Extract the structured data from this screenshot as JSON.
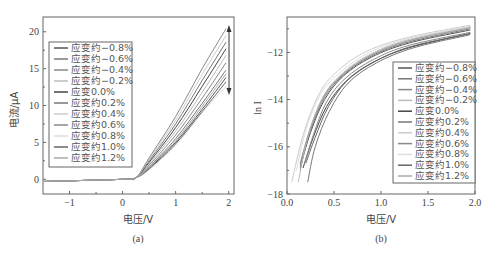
{
  "chart_data": [
    {
      "type": "line",
      "panel_label": "(a)",
      "title": "",
      "xlabel": "电压/V",
      "ylabel": "电流/μA",
      "xlim": [
        -1.5,
        2.1
      ],
      "ylim": [
        -2,
        22
      ],
      "xticks": [
        -1,
        0,
        1,
        2
      ],
      "xtick_labels": [
        "−1",
        "0",
        "1",
        "2"
      ],
      "yticks": [
        0,
        5,
        10,
        15,
        20
      ],
      "ytick_labels": [
        "0",
        "5",
        "10",
        "15",
        "20"
      ],
      "grid": false,
      "legend_position": "upper left",
      "annotation": "double-headed arrow at V=2 spanning ~12 to ~20.5 μA",
      "series": [
        {
          "name": "应变约−0.8%",
          "color": "#555555",
          "x": [
            -1.5,
            0,
            0.25,
            0.5,
            1.0,
            1.5,
            1.95
          ],
          "values": [
            -0.3,
            0,
            0.2,
            1.5,
            5.0,
            9.5,
            13.8
          ]
        },
        {
          "name": "应变约−0.6%",
          "color": "#777777",
          "x": [
            -1.5,
            0,
            0.25,
            0.5,
            1.0,
            1.5,
            1.95
          ],
          "values": [
            -0.3,
            0,
            0.2,
            1.7,
            5.5,
            10.3,
            14.8
          ]
        },
        {
          "name": "应变约−0.4%",
          "color": "#888888",
          "x": [
            -1.5,
            0,
            0.25,
            0.5,
            1.0,
            1.5,
            1.95
          ],
          "values": [
            -0.3,
            0,
            0.2,
            1.9,
            6.0,
            11.0,
            15.8
          ]
        },
        {
          "name": "应变约−0.2%",
          "color": "#bbbbbb",
          "x": [
            -1.5,
            0,
            0.25,
            0.5,
            1.0,
            1.5,
            1.95
          ],
          "values": [
            -0.3,
            0,
            0.2,
            2.1,
            6.5,
            11.8,
            16.8
          ]
        },
        {
          "name": "应变0.0%",
          "color": "#444444",
          "x": [
            -1.5,
            0,
            0.25,
            0.5,
            1.0,
            1.5,
            1.95
          ],
          "values": [
            -0.3,
            0,
            0.2,
            2.3,
            7.0,
            12.6,
            17.7
          ]
        },
        {
          "name": "应变约0.2%",
          "color": "#777777",
          "x": [
            -1.5,
            0,
            0.25,
            0.5,
            1.0,
            1.5,
            1.95
          ],
          "values": [
            -0.3,
            0,
            0.2,
            2.5,
            7.5,
            13.4,
            18.6
          ]
        },
        {
          "name": "应变约0.4%",
          "color": "#cccccc",
          "x": [
            -1.5,
            0,
            0.25,
            0.5,
            1.0,
            1.5,
            1.95
          ],
          "values": [
            -0.3,
            0,
            0.2,
            2.7,
            8.0,
            14.2,
            19.5
          ]
        },
        {
          "name": "应变约0.6%",
          "color": "#888888",
          "x": [
            -1.5,
            0,
            0.25,
            0.5,
            1.0,
            1.5,
            1.95
          ],
          "values": [
            -0.3,
            0,
            0.2,
            2.9,
            8.5,
            15.0,
            20.4
          ]
        },
        {
          "name": "应变约0.8%",
          "color": "#dddddd",
          "x": [
            -1.5,
            0,
            0.25,
            0.5,
            1.0,
            1.5,
            1.95
          ],
          "values": [
            -0.3,
            0,
            0.2,
            1.3,
            4.6,
            9.0,
            12.6
          ]
        },
        {
          "name": "应变约1.0%",
          "color": "#666666",
          "x": [
            -1.5,
            0,
            0.25,
            0.5,
            1.0,
            1.5,
            1.95
          ],
          "values": [
            -0.3,
            0,
            0.2,
            1.4,
            4.8,
            9.2,
            13.2
          ]
        },
        {
          "name": "应变约1.2%",
          "color": "#aaaaaa",
          "x": [
            -1.5,
            0,
            0.25,
            0.5,
            1.0,
            1.5,
            1.95
          ],
          "values": [
            -0.3,
            0,
            0.2,
            1.6,
            5.2,
            9.9,
            14.3
          ]
        }
      ]
    },
    {
      "type": "line",
      "panel_label": "(b)",
      "title": "",
      "xlabel": "电压/V",
      "ylabel": "ln I",
      "xlim": [
        0.0,
        2.0
      ],
      "ylim": [
        -18,
        -10.5
      ],
      "xticks": [
        0.0,
        0.5,
        1.0,
        1.5,
        2.0
      ],
      "xtick_labels": [
        "0.0",
        "0.5",
        "1.0",
        "1.5",
        "2.0"
      ],
      "yticks": [
        -18,
        -16,
        -14,
        -12
      ],
      "ytick_labels": [
        "−18",
        "−16",
        "−14",
        "−12"
      ],
      "grid": false,
      "legend_position": "center right",
      "series": [
        {
          "name": "应变约−0.8%",
          "color": "#555555",
          "x": [
            0.14,
            0.25,
            0.4,
            0.6,
            0.9,
            1.3,
            1.95
          ],
          "values": [
            -16.9,
            -15.4,
            -14.0,
            -13.0,
            -12.2,
            -11.6,
            -11.05
          ]
        },
        {
          "name": "应变约−0.6%",
          "color": "#777777",
          "x": [
            0.14,
            0.25,
            0.4,
            0.6,
            0.9,
            1.3,
            1.95
          ],
          "values": [
            -16.8,
            -15.3,
            -13.9,
            -12.95,
            -12.15,
            -11.55,
            -11.0
          ]
        },
        {
          "name": "应变约−0.4%",
          "color": "#888888",
          "x": [
            0.14,
            0.25,
            0.4,
            0.6,
            0.9,
            1.3,
            1.95
          ],
          "values": [
            -16.7,
            -15.2,
            -13.8,
            -12.9,
            -12.1,
            -11.5,
            -10.95
          ]
        },
        {
          "name": "应变约−0.2%",
          "color": "#bbbbbb",
          "x": [
            0.12,
            0.22,
            0.38,
            0.6,
            0.9,
            1.3,
            1.95
          ],
          "values": [
            -17.5,
            -15.6,
            -13.9,
            -12.85,
            -12.05,
            -11.45,
            -10.9
          ]
        },
        {
          "name": "应变0.0%",
          "color": "#444444",
          "x": [
            0.17,
            0.28,
            0.42,
            0.62,
            0.9,
            1.3,
            1.95
          ],
          "values": [
            -16.9,
            -15.6,
            -14.3,
            -13.25,
            -12.45,
            -11.8,
            -11.2
          ]
        },
        {
          "name": "应变约0.2%",
          "color": "#777777",
          "x": [
            0.22,
            0.3,
            0.45,
            0.65,
            0.95,
            1.35,
            1.95
          ],
          "values": [
            -17.5,
            -16.0,
            -14.5,
            -13.3,
            -12.45,
            -11.8,
            -11.25
          ]
        },
        {
          "name": "应变约0.4%",
          "color": "#cccccc",
          "x": [
            0.05,
            0.18,
            0.35,
            0.55,
            0.85,
            1.3,
            1.95
          ],
          "values": [
            -17.5,
            -15.4,
            -13.7,
            -12.75,
            -11.95,
            -11.35,
            -10.85
          ]
        },
        {
          "name": "应变约0.6%",
          "color": "#888888",
          "x": [
            0.18,
            0.28,
            0.42,
            0.62,
            0.92,
            1.3,
            1.95
          ],
          "values": [
            -16.8,
            -15.5,
            -14.1,
            -13.1,
            -12.3,
            -11.7,
            -11.15
          ]
        },
        {
          "name": "应变约0.8%",
          "color": "#dddddd",
          "x": [
            0.1,
            0.2,
            0.36,
            0.58,
            0.88,
            1.3,
            1.95
          ],
          "values": [
            -17.0,
            -15.3,
            -13.75,
            -12.8,
            -12.0,
            -11.4,
            -10.9
          ]
        },
        {
          "name": "应变约1.0%",
          "color": "#666666",
          "x": [
            0.2,
            0.3,
            0.44,
            0.64,
            0.93,
            1.32,
            1.95
          ],
          "values": [
            -16.7,
            -15.6,
            -14.3,
            -13.2,
            -12.4,
            -11.75,
            -11.2
          ]
        },
        {
          "name": "应变约1.2%",
          "color": "#aaaaaa",
          "x": [
            0.14,
            0.24,
            0.4,
            0.6,
            0.9,
            1.3,
            1.95
          ],
          "values": [
            -17.0,
            -15.3,
            -13.85,
            -12.9,
            -12.1,
            -11.5,
            -10.95
          ]
        }
      ]
    }
  ]
}
